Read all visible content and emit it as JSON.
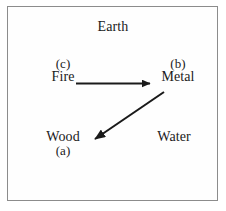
{
  "figure": {
    "type": "five-elements-cycle-diagram",
    "border_color": "#8c8c8c",
    "background_color": "#ffffff",
    "ink_color": "#1a1a1a"
  },
  "nodes": {
    "earth": {
      "name": "Earth",
      "tag": ""
    },
    "fire": {
      "name": "Fire",
      "tag": "(c)"
    },
    "metal": {
      "name": "Metal",
      "tag": "(b)"
    },
    "wood": {
      "name": "Wood",
      "tag": "(a)"
    },
    "water": {
      "name": "Water",
      "tag": ""
    }
  },
  "arrows": [
    {
      "id": "fire-to-metal",
      "from": "Fire",
      "to": "Metal",
      "style": "solid-straight-filled-head"
    },
    {
      "id": "metal-to-wood",
      "from": "Metal",
      "to": "Wood",
      "style": "solid-straight-filled-head"
    }
  ]
}
